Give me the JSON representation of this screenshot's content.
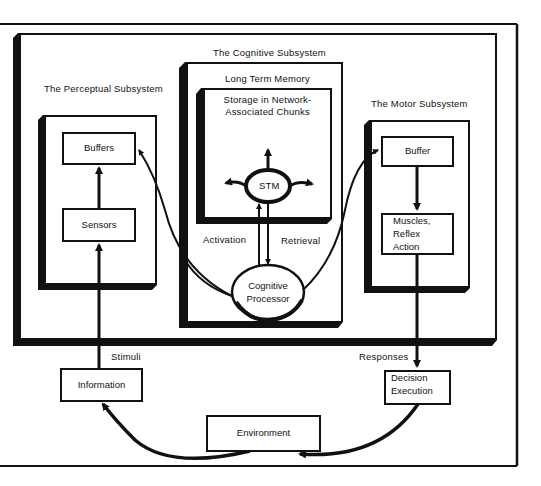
{
  "diagram": {
    "subsystems": {
      "cognitive": {
        "label": "The Cognitive Subsystem",
        "long_term_memory": {
          "label": "Long Term Memory",
          "storage_line1": "Storage in Network-",
          "storage_line2": "Associated Chunks"
        },
        "stm": "STM",
        "processor_line1": "Cognitive",
        "processor_line2": "Processor",
        "activation": "Activation",
        "retrieval": "Retrieval"
      },
      "perceptual": {
        "label": "The Perceptual Subsystem",
        "buffers": "Buffers",
        "sensors": "Sensors"
      },
      "motor": {
        "label": "The Motor Subsystem",
        "buffer": "Buffer",
        "muscles_line1": "Muscles,",
        "muscles_line2": "Reflex",
        "muscles_line3": "Action"
      }
    },
    "external": {
      "stimuli": "Stimuli",
      "responses": "Responses",
      "information": "Information",
      "decision_line1": "Decision",
      "decision_line2": "Execution",
      "environment": "Environment"
    },
    "colors": {
      "ink": "#111111",
      "paper": "#ffffff"
    }
  }
}
